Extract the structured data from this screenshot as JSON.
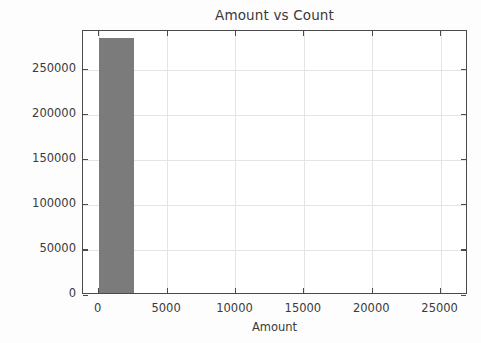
{
  "figure": {
    "background_color": "#fdfdfd",
    "scan_artifact_text": "· · ·"
  },
  "chart_data": {
    "type": "bar",
    "title": "Amount vs Count",
    "xlabel": "Amount",
    "ylabel": "Count",
    "grid": true,
    "legend": null,
    "bar_color": "#7b7b7b",
    "xlim": [
      -1150,
      27000
    ],
    "ylim": [
      0,
      293000
    ],
    "xticks": [
      0,
      5000,
      10000,
      15000,
      20000,
      25000
    ],
    "xticklabels": [
      "0",
      "5000",
      "10000",
      "15000",
      "20000",
      "25000"
    ],
    "yticks": [
      0,
      50000,
      100000,
      150000,
      200000,
      250000
    ],
    "yticklabels": [
      "0",
      "50000",
      "100000",
      "150000",
      "200000",
      "250000"
    ],
    "bars": [
      {
        "x_start": 0,
        "x_end": 2600,
        "center": 1300,
        "value": 283000,
        "label": "0-2600"
      }
    ],
    "categories": [
      "0-2600"
    ],
    "values": [
      283000
    ]
  }
}
